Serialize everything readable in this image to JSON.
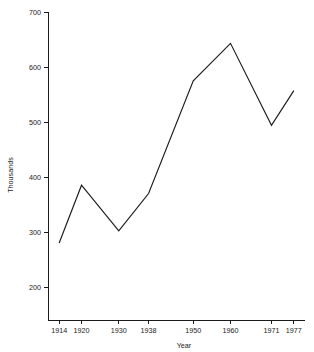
{
  "chart_data": {
    "type": "line",
    "title": "",
    "xlabel": "Year",
    "ylabel": "Thousands",
    "x": [
      1914,
      1920,
      1930,
      1938,
      1950,
      1960,
      1971,
      1977
    ],
    "categories": [
      "1914",
      "1920",
      "1930",
      "1938",
      "1950",
      "1960",
      "1971",
      "1977"
    ],
    "values": [
      280,
      385,
      302,
      370,
      575,
      643,
      494,
      557
    ],
    "series": [
      {
        "name": "Thousands",
        "values": [
          280,
          385,
          302,
          370,
          575,
          643,
          494,
          557
        ]
      }
    ],
    "xlim": [
      1911,
      1980
    ],
    "ylim": [
      140,
      700
    ],
    "xticks": [
      1914,
      1920,
      1930,
      1938,
      1950,
      1960,
      1971,
      1977
    ],
    "xtick_labels": [
      "1914",
      "1920",
      "1930",
      "1938",
      "1950",
      "1960",
      "1971",
      "1977"
    ],
    "yticks": [
      200,
      300,
      400,
      500,
      600,
      700
    ],
    "ytick_labels": [
      "200",
      "300",
      "400",
      "500",
      "600",
      "700"
    ],
    "grid": false,
    "legend": false,
    "line_color": "#1a1a1a",
    "background_color": "#ffffff"
  },
  "axes": {
    "y_axis_title": "Thousands",
    "x_axis_title": "Year"
  }
}
